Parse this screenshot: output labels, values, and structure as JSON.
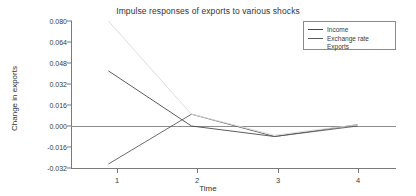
{
  "chart_data": {
    "type": "line",
    "title": "Impulse responses of exports to various shocks",
    "xlabel": "Time",
    "ylabel": "Change in exports",
    "x": [
      1,
      2,
      3,
      4
    ],
    "xtick_labels": [
      "1",
      "2",
      "3",
      "4"
    ],
    "ytick_labels": [
      "0.080",
      "0.064",
      "0.048",
      "0.032",
      "0.016",
      "0.000",
      "-0.016",
      "-0.032"
    ],
    "ytick_values": [
      0.08,
      0.064,
      0.048,
      0.032,
      0.016,
      0.0,
      -0.016,
      -0.032
    ],
    "ylim": [
      -0.032,
      0.08
    ],
    "xlim": [
      0.55,
      4.45
    ],
    "grid": false,
    "legend_position": "top-right",
    "zero_line": 0.0,
    "series": [
      {
        "name": "Income",
        "color": "#4a4a4a",
        "values": [
          0.042,
          0.0,
          -0.008,
          0.001
        ]
      },
      {
        "name": "Exchange rate",
        "color": "#5a5a5a",
        "values": [
          -0.029,
          0.009,
          -0.008,
          0.0
        ]
      },
      {
        "name": "Exports",
        "color": "#d8d8d8",
        "values": [
          0.08,
          0.009,
          -0.007,
          0.001
        ]
      }
    ]
  },
  "legend": {
    "items": [
      {
        "label": "Income",
        "swatch": "line-swatch"
      },
      {
        "label": "Exchange rate",
        "swatch": "line-swatch"
      },
      {
        "label": "Exports",
        "swatch": "none"
      }
    ]
  },
  "axes": {
    "y_title": "Change in exports",
    "x_title": "Time"
  },
  "colors": {
    "axis": "#7a7a7a",
    "text": "#3a3a3a",
    "background": "#ffffff"
  }
}
